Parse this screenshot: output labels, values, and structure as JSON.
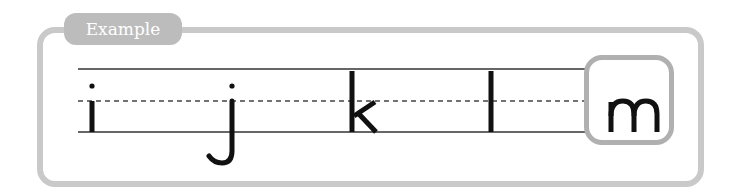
{
  "tab": {
    "label": "Example"
  },
  "letters": [
    {
      "char": "i",
      "x": 91
    },
    {
      "char": "j",
      "x": 231
    },
    {
      "char": "k",
      "x": 352
    },
    {
      "char": "l",
      "x": 490
    },
    {
      "char": "m",
      "x": 632,
      "highlighted": true
    }
  ],
  "guidelines": {
    "top_y": 69,
    "mid_y": 101,
    "base_y": 132,
    "line_color": "#333333",
    "dash_color": "#444444"
  },
  "colors": {
    "frame": "#c9c9c9",
    "tab": "#bcbcbc",
    "highlight_box": "#b0b0b0",
    "ink": "#111111"
  }
}
